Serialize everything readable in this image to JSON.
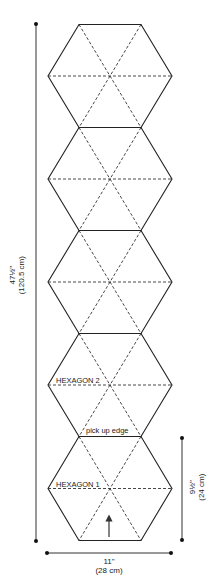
{
  "diagram": {
    "type": "knitting-schematic",
    "shape": "hexagon-strip",
    "hexagon_count": 5,
    "labels": {
      "hexagon_1": "HEXAGON 1",
      "hexagon_2": "HEXAGON 2",
      "pick_up_edge": "pick up edge"
    },
    "dimensions": {
      "total_length": {
        "imperial": "47½\"",
        "metric": "(120.5 cm)"
      },
      "hexagon_height": {
        "imperial": "9½\"",
        "metric": "(24 cm)"
      },
      "width": {
        "imperial": "11\"",
        "metric": "(28 cm)"
      }
    },
    "annotations": {
      "direction_arrow": "up-arrow (knitting direction)"
    },
    "colors": {
      "line": "#222222",
      "dashed": "#333333",
      "background": "#ffffff"
    }
  }
}
